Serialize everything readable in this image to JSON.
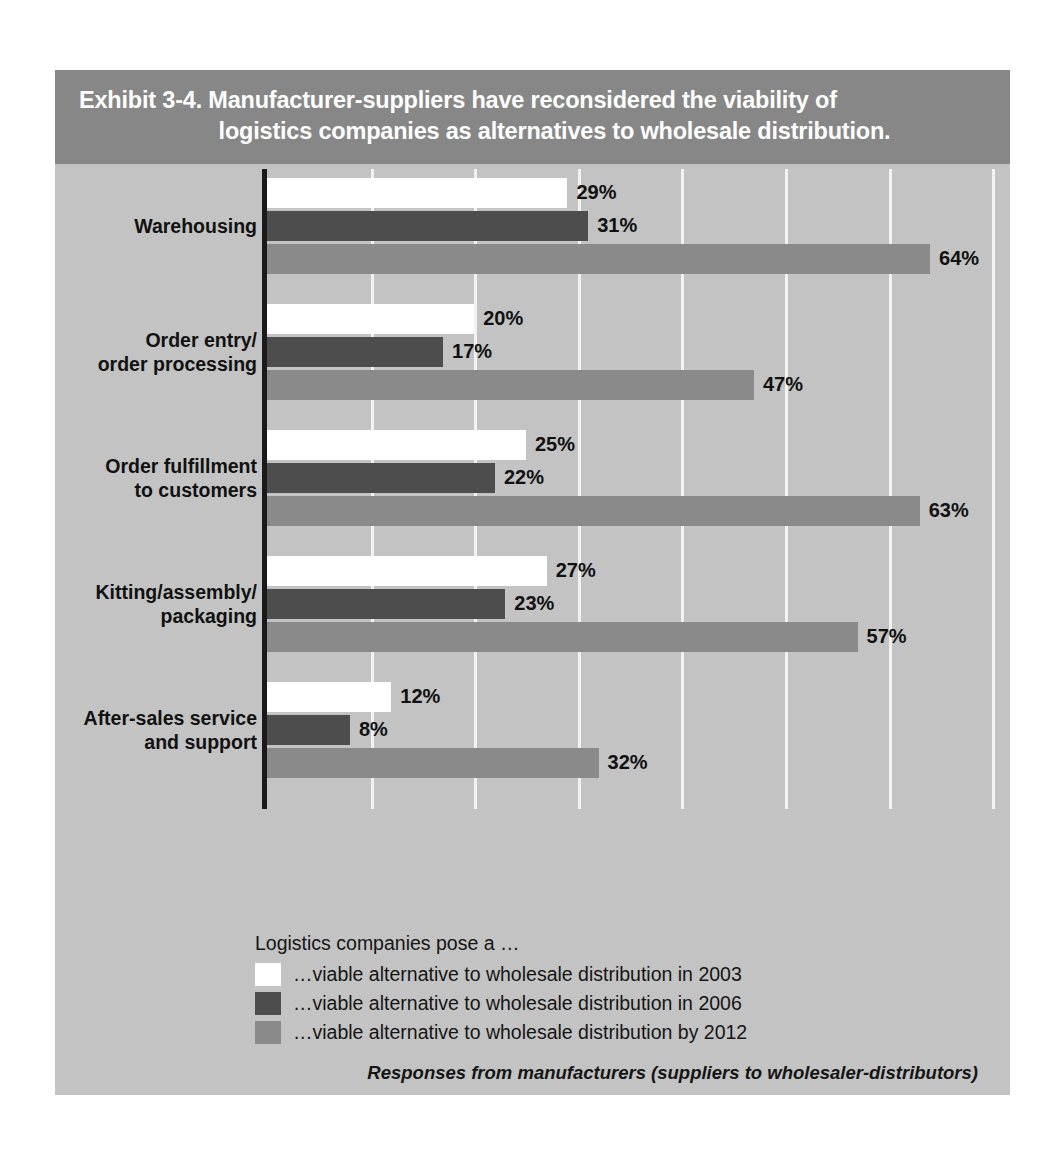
{
  "exhibit": {
    "title_line_1": "Exhibit 3-4. Manufacturer-suppliers have reconsidered the viability of",
    "title_line_2": "logistics companies as alternatives to wholesale distribution.",
    "footnote": "Responses from manufacturers (suppliers to wholesaler-distributors)"
  },
  "legend": {
    "title": "Logistics companies pose a …",
    "items": [
      {
        "label": "…viable alternative to wholesale distribution in 2003",
        "color": "#ffffff"
      },
      {
        "label": "…viable alternative to wholesale distribution in 2006",
        "color": "#4d4d4d"
      },
      {
        "label": "…viable alternative to wholesale distribution by 2012",
        "color": "#8a8a8a"
      }
    ]
  },
  "colors": {
    "panel_background": "#c3c3c3",
    "title_band": "#878787",
    "gridline": "#f2f2f2",
    "axis": "#1a1a1a",
    "series_2003": "#ffffff",
    "series_2006": "#4d4d4d",
    "series_2012": "#8a8a8a"
  },
  "chart_data": {
    "type": "bar",
    "orientation": "horizontal",
    "title": "Exhibit 3-4. Manufacturer-suppliers have reconsidered the viability of logistics companies as alternatives to wholesale distribution.",
    "xlabel": "",
    "ylabel": "",
    "xlim": [
      0,
      70
    ],
    "xticks": [
      0,
      10,
      20,
      30,
      40,
      50,
      60,
      70
    ],
    "xtick_labels": [
      "",
      "",
      "",
      "",
      "",
      "",
      "",
      ""
    ],
    "grid": true,
    "grid_axis": "x",
    "legend_position": "bottom-left",
    "value_suffix": "%",
    "categories": [
      "Warehousing",
      "Order entry/\norder processing",
      "Order fulfillment\nto customers",
      "Kitting/assembly/\npackaging",
      "After-sales service\nand support"
    ],
    "category_lines": [
      [
        "Warehousing"
      ],
      [
        "Order entry/",
        "order processing"
      ],
      [
        "Order fulfillment",
        "to customers"
      ],
      [
        "Kitting/assembly/",
        "packaging"
      ],
      [
        "After-sales service",
        "and support"
      ]
    ],
    "series": [
      {
        "name": "…viable alternative to wholesale distribution in 2003",
        "short_name": "2003",
        "color": "#ffffff",
        "values": [
          29,
          20,
          25,
          27,
          12
        ],
        "labels": [
          "29%",
          "20%",
          "25%",
          "27%",
          "12%"
        ]
      },
      {
        "name": "…viable alternative to wholesale distribution in 2006",
        "short_name": "2006",
        "color": "#4d4d4d",
        "values": [
          31,
          17,
          22,
          23,
          8
        ],
        "labels": [
          "31%",
          "17%",
          "22%",
          "23%",
          "8%"
        ]
      },
      {
        "name": "…viable alternative to wholesale distribution by 2012",
        "short_name": "2012",
        "color": "#8a8a8a",
        "values": [
          64,
          47,
          63,
          57,
          32
        ],
        "labels": [
          "64%",
          "47%",
          "63%",
          "57%",
          "32%"
        ]
      }
    ]
  }
}
